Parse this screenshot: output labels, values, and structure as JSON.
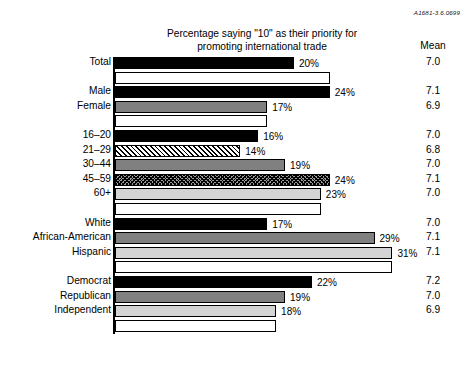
{
  "corner_code": "A1681-3.6.0699",
  "title_line1": "Percentage saying \"10\" as their priority for",
  "title_line2": "promoting international trade",
  "mean_header": "Mean",
  "chart_data": {
    "type": "bar",
    "orientation": "horizontal",
    "title": "Percentage saying \"10\" as their priority for promoting international trade",
    "xlabel": "",
    "ylabel": "",
    "xlim": [
      0,
      33
    ],
    "grid": false,
    "legend": false,
    "value_suffix": "%",
    "extra_column_header": "Mean",
    "categories": [
      "Total",
      "Male",
      "Female",
      "16–20",
      "21–29",
      "30–44",
      "45–59",
      "60+",
      "White",
      "African-American",
      "Hispanic",
      "Democrat",
      "Republican",
      "Independent"
    ],
    "values": [
      20,
      24,
      17,
      16,
      14,
      19,
      24,
      23,
      17,
      29,
      31,
      22,
      19,
      18
    ],
    "value_labels": [
      "20%",
      "24%",
      "17%",
      "16%",
      "14%",
      "19%",
      "24%",
      "23%",
      "17%",
      "29%",
      "31%",
      "22%",
      "19%",
      "18%"
    ],
    "means": [
      "7.0",
      "7.1",
      "6.9",
      "7.0",
      "6.8",
      "7.0",
      "7.1",
      "7.0",
      "7.0",
      "7.1",
      "7.1",
      "7.2",
      "7.0",
      "6.9"
    ],
    "fills": [
      "black",
      "black",
      "gray",
      "black",
      "hatch",
      "gray",
      "crosshatch",
      "lightgray",
      "black",
      "gray",
      "lightgray",
      "black",
      "gray",
      "lightgray"
    ],
    "groups": [
      {
        "name": "overall",
        "rows": [
          0
        ]
      },
      {
        "name": "gender",
        "rows": [
          1,
          2
        ]
      },
      {
        "name": "age",
        "rows": [
          3,
          4,
          5,
          6,
          7
        ]
      },
      {
        "name": "race",
        "rows": [
          8,
          9,
          10
        ]
      },
      {
        "name": "party",
        "rows": [
          11,
          12,
          13
        ]
      }
    ]
  },
  "colors": {
    "black": "#000000",
    "gray": "#808080",
    "lightgray": "#d4d4d4",
    "white": "#ffffff",
    "axis": "#000000"
  }
}
